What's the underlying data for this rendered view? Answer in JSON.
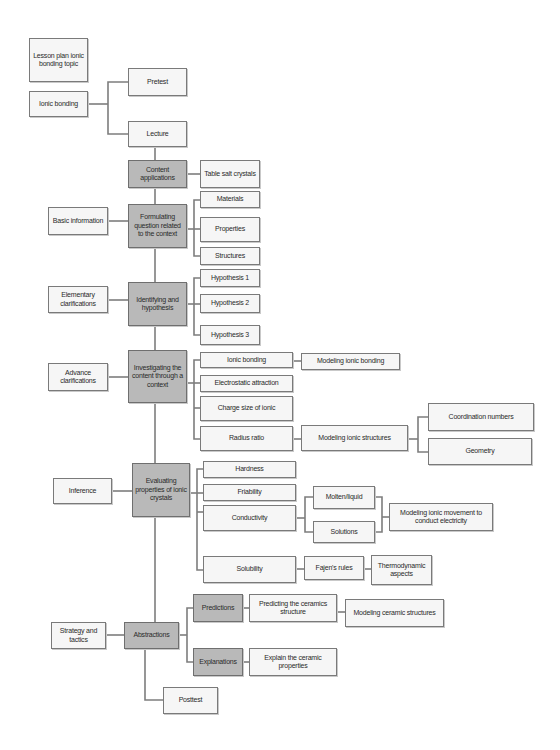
{
  "diagram": {
    "type": "flowchart",
    "title": "Lesson plan ionic bonding topic",
    "nodes": {
      "lesson_plan": "Lesson plan ionic bonding topic",
      "ionic_bonding_topic": "Ionic bonding",
      "pretest": "Pretest",
      "lecture": "Lecture",
      "content_applications": "Content applications",
      "table_salt": "Table salt crystals",
      "basic_information": "Basic information",
      "formulating": "Formulating question related to the context",
      "materials": "Materials",
      "properties": "Properties",
      "structures": "Structures",
      "elementary": "Elementary clarifications",
      "identifying": "Identifying and hypothesis",
      "hypothesis1": "Hypothesis 1",
      "hypothesis2": "Hypothesis 2",
      "hypothesis3": "Hypothesis 3",
      "advance": "Advance clarifications",
      "investigating": "Investigating the content through a context",
      "ionic_bonding_sub": "Ionic bonding",
      "modeling_ionic_bonding": "Modeling ionic bonding",
      "electrostatic": "Electrostatic attraction",
      "charge_size": "Charge size of ionic",
      "radius_ratio": "Radius ratio",
      "modeling_ionic_structures": "Modeling ionic structures",
      "coordination_numbers": "Coordination numbers",
      "geometry": "Geometry",
      "inference": "Inference",
      "evaluating": "Evaluating properties of ionic crystals",
      "hardness": "Hardness",
      "friability": "Friability",
      "conductivity": "Conductivity",
      "molten_liquid": "Molten/liquid",
      "solutions": "Solutions",
      "modeling_ionic_movement": "Modeling ionic movement to conduct electricity",
      "solubility": "Solubility",
      "fajens_rules": "Fajen's rules",
      "thermodynamic": "Thermodynamic aspects",
      "strategy": "Strategy and tactics",
      "abstractions": "Abstractions",
      "predictions": "Predictions",
      "predicting_ceramics": "Predicting the ceramics structure",
      "modeling_ceramic": "Modeling ceramic structures",
      "explanations": "Explanations",
      "explain_ceramic": "Explain the ceramic properties",
      "posttest": "Posttest"
    },
    "colors": {
      "light_box": "#f6f6f6",
      "dark_box": "#b9b9b9",
      "border": "#7a7a7a",
      "connector": "#7d7d7d"
    }
  }
}
